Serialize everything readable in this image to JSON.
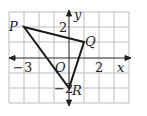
{
  "diagram": {
    "type": "coordinate-grid-triangle",
    "grid": {
      "x_min": -4,
      "x_max": 4,
      "y_min": -3,
      "y_max": 3,
      "unit_px": 15,
      "color": "#bdbdbd"
    },
    "axes": {
      "x_label": "x",
      "y_label": "y",
      "origin_label": "O",
      "color": "#222222"
    },
    "tick_labels": [
      {
        "axis": "x",
        "value": -3,
        "text": "−3"
      },
      {
        "axis": "x",
        "value": 2,
        "text": "2"
      },
      {
        "axis": "y",
        "value": 2,
        "text": "2"
      },
      {
        "axis": "y",
        "value": -2,
        "text": "−2"
      }
    ],
    "points": [
      {
        "name": "P",
        "x": -3,
        "y": 2
      },
      {
        "name": "Q",
        "x": 1,
        "y": 1
      },
      {
        "name": "R",
        "x": 0,
        "y": -2
      }
    ],
    "polygon": [
      "P",
      "Q",
      "R"
    ],
    "line_color": "#1a1a1a"
  }
}
